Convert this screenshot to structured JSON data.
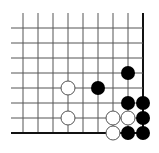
{
  "board": {
    "description": "Go problem diagram (lower-right corner)",
    "columns": 9,
    "rows": 8,
    "origin_x": 23,
    "origin_y": 28,
    "spacing": 15,
    "left_extent": 11,
    "top_extent": 13,
    "edges": {
      "right": true,
      "bottom": true
    },
    "line_color": "#555555",
    "edge_color": "#111111",
    "stone_radius": 7
  },
  "stones": [
    {
      "color": "black",
      "col": 7,
      "row": 3
    },
    {
      "color": "black",
      "col": 5,
      "row": 4
    },
    {
      "color": "white",
      "col": 3,
      "row": 4
    },
    {
      "color": "black",
      "col": 7,
      "row": 5
    },
    {
      "color": "black",
      "col": 8,
      "row": 5
    },
    {
      "color": "white",
      "col": 3,
      "row": 6
    },
    {
      "color": "white",
      "col": 6,
      "row": 6
    },
    {
      "color": "white",
      "col": 7,
      "row": 6
    },
    {
      "color": "black",
      "col": 8,
      "row": 6
    },
    {
      "color": "white",
      "col": 6,
      "row": 7
    },
    {
      "color": "black",
      "col": 7,
      "row": 7
    },
    {
      "color": "black",
      "col": 8,
      "row": 7
    }
  ]
}
